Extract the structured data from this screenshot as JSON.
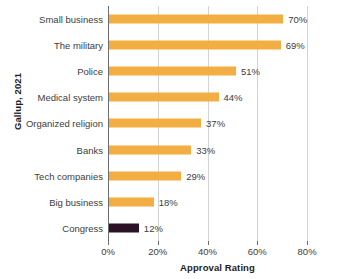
{
  "chart_data": {
    "type": "bar",
    "orientation": "horizontal",
    "title": "",
    "xlabel": "Approval Rating",
    "ylabel": "Gallup, 2021",
    "xlim": [
      0,
      88
    ],
    "xticks": [
      0,
      20,
      40,
      60,
      80
    ],
    "xtick_labels": [
      "0%",
      "20%",
      "40%",
      "60%",
      "80%"
    ],
    "grid": "vertical",
    "legend": "none",
    "categories": [
      "Small business",
      "The military",
      "Police",
      "Medical system",
      "Organized religion",
      "Banks",
      "Tech companies",
      "Big business",
      "Congress"
    ],
    "values": [
      70,
      69,
      51,
      44,
      37,
      33,
      29,
      18,
      12
    ],
    "value_labels": [
      "70%",
      "69%",
      "51%",
      "44%",
      "37%",
      "33%",
      "29%",
      "18%",
      "12%"
    ],
    "bar_color": "#f3ae43",
    "highlight_color": "#2c1227",
    "highlight_category": "Congress",
    "gridline_color": "#d3d3d3",
    "axis_color": "#6d6d6d",
    "text_color": "#3d3d3d"
  }
}
